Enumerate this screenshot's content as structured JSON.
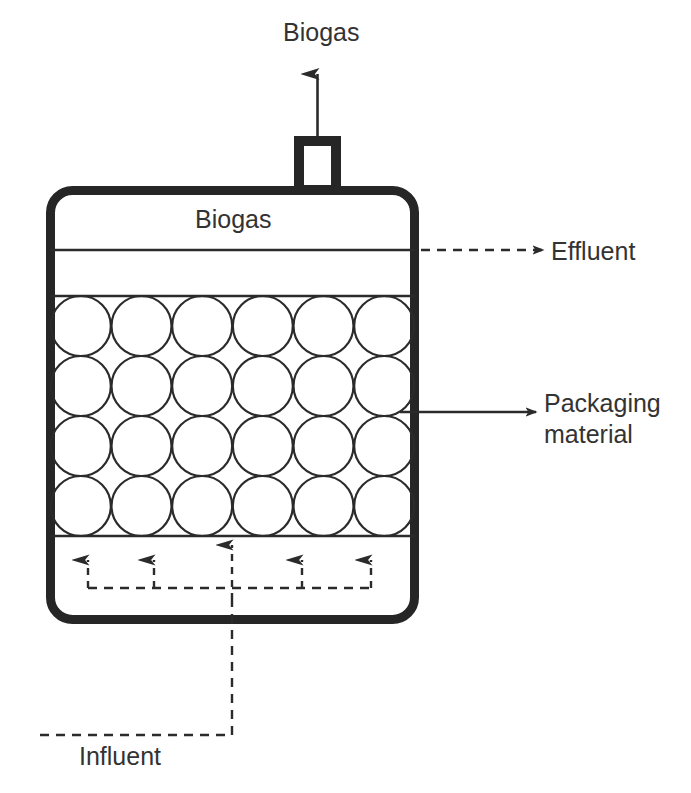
{
  "figure": {
    "kind": "process-flow-diagram",
    "background_color": "#ffffff",
    "line_color": "#2b2b2b",
    "wall_color": "#262626"
  },
  "labels": {
    "biogas_outlet": "Biogas",
    "biogas_headspace": "Biogas",
    "effluent": "Effluent",
    "packaging_material_line1": "Packaging",
    "packaging_material_line2": "material",
    "influent": "Influent"
  },
  "vessel": {
    "wall_thickness_px": 9,
    "corner_radius_px": 22,
    "left_px": 46,
    "right_px": 419,
    "top_px": 186,
    "bottom_px": 624,
    "headspace_divider_y_px": 250,
    "bed_top_y_px": 296,
    "bed_bottom_y_px": 536
  },
  "gas_nozzle": {
    "left_px": 294,
    "right_px": 341,
    "top_px": 136,
    "bottom_px": 190,
    "wall_thickness_px": 10
  },
  "packed_bed": {
    "columns": 6,
    "rows": 4,
    "circle_count": 24,
    "circle_diameter_px": 60,
    "stroke_width_px": 2.2,
    "fill": "none"
  },
  "flows": [
    {
      "name": "biogas-out",
      "style": "solid",
      "direction": "up",
      "label": "Biogas"
    },
    {
      "name": "effluent-out",
      "style": "dashed",
      "direction": "right",
      "label": "Effluent"
    },
    {
      "name": "packaging-pointer",
      "style": "solid",
      "direction": "right",
      "label": "Packaging material"
    },
    {
      "name": "influent-in",
      "style": "dashed",
      "direction": "up",
      "label": "Influent"
    }
  ],
  "distributor": {
    "arrow_count": 5,
    "style": "dashed",
    "manifold_y_px": 588,
    "arrow_x_px": [
      88,
      154,
      232,
      302,
      371
    ]
  }
}
